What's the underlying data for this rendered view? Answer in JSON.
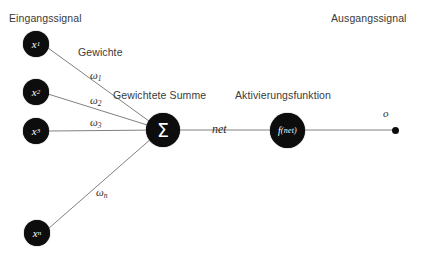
{
  "diagram": {
    "title_left": "Eingangssignal",
    "title_right": "Ausgangssignal",
    "label_weights": "Gewichte",
    "label_weighted_sum": "Gewichtete Summe",
    "label_activation": "Aktivierungsfunktion",
    "label_net": "net",
    "label_output": "o",
    "colors": {
      "node_fill": "#0d0d0d",
      "node_text": "#ffffff",
      "wire": "#808080",
      "text": "#3a3a3a",
      "background": "#ffffff"
    },
    "input_nodes": [
      {
        "base": "x",
        "sub": "1",
        "cx": 36,
        "cy": 44
      },
      {
        "base": "x",
        "sub": "2",
        "cx": 36,
        "cy": 92
      },
      {
        "base": "x",
        "sub": "3",
        "cx": 36,
        "cy": 131
      },
      {
        "base": "x",
        "sub": "n",
        "cx": 37,
        "cy": 233
      }
    ],
    "weight_labels": [
      {
        "base": "ω",
        "sub": "1",
        "x": 90,
        "y": 69
      },
      {
        "base": "ω",
        "sub": "2",
        "x": 90,
        "y": 94
      },
      {
        "base": "ω",
        "sub": "3",
        "x": 90,
        "y": 116
      },
      {
        "base": "ω",
        "sub": "n",
        "x": 96,
        "y": 186
      }
    ],
    "sum_node": {
      "glyph": "Σ",
      "cx": 163,
      "cy": 130
    },
    "activation_node": {
      "glyph_f": "f",
      "glyph_arg": "(net)",
      "cx": 287,
      "cy": 130
    },
    "output_dot": {
      "cx": 395,
      "cy": 130
    }
  }
}
